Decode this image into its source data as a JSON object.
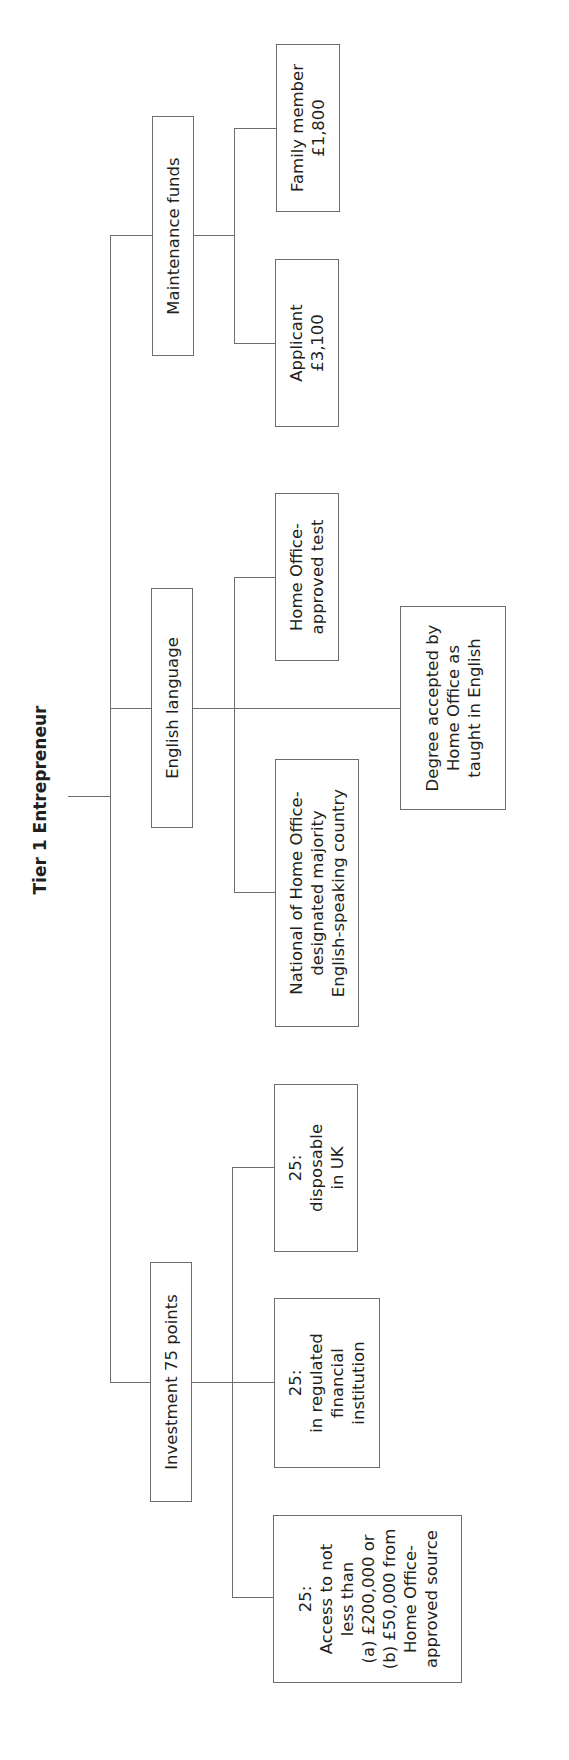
{
  "title": "Tier 1 Entrepreneur",
  "orientation": "rotated 90° counter-clockwise",
  "categories": [
    {
      "label": "Maintenance funds",
      "children": [
        {
          "lines": [
            "Family member",
            "£1,800"
          ]
        },
        {
          "lines": [
            "Applicant",
            "£3,100"
          ]
        }
      ]
    },
    {
      "label": "English language",
      "children": [
        {
          "lines": [
            "Home Office-",
            "approved test"
          ]
        },
        {
          "lines": [
            "Degree accepted by",
            "Home Office as",
            "taught in English"
          ]
        },
        {
          "lines": [
            "National of Home Office-",
            "designated majority",
            "English-speaking country"
          ]
        }
      ]
    },
    {
      "label": "Investment 75 points",
      "children": [
        {
          "lines": [
            "25:",
            "disposable",
            "in UK"
          ]
        },
        {
          "lines": [
            "25:",
            "in regulated",
            "financial",
            "institution"
          ]
        },
        {
          "lines": [
            "25:",
            "Access to not",
            "less than",
            "(a) £200,000 or",
            "(b) £50,000 from",
            "Home Office-",
            "approved source"
          ]
        }
      ]
    }
  ],
  "colors": {
    "line": "#6d6d6d",
    "text": "#231f20",
    "background": "#ffffff"
  }
}
